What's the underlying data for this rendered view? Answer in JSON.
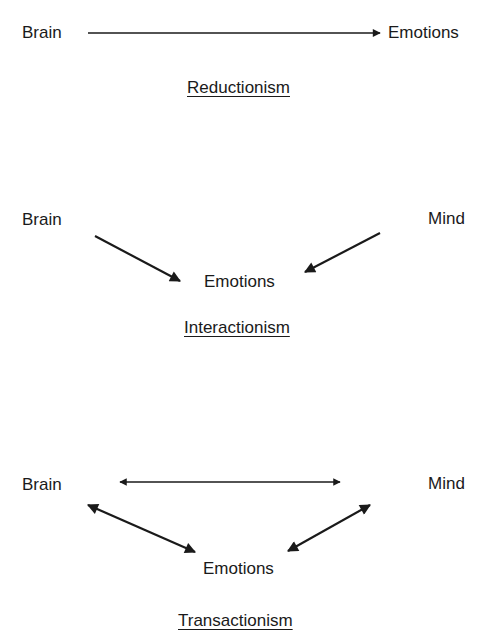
{
  "diagrams": [
    {
      "title": "Reductionism",
      "nodes": {
        "brain": "Brain",
        "emotions": "Emotions"
      },
      "relations": [
        {
          "from": "Brain",
          "to": "Emotions",
          "type": "one-way"
        }
      ]
    },
    {
      "title": "Interactionism",
      "nodes": {
        "brain": "Brain",
        "mind": "Mind",
        "emotions": "Emotions"
      },
      "relations": [
        {
          "from": "Brain",
          "to": "Emotions",
          "type": "one-way"
        },
        {
          "from": "Mind",
          "to": "Emotions",
          "type": "one-way"
        }
      ]
    },
    {
      "title": "Transactionism",
      "nodes": {
        "brain": "Brain",
        "mind": "Mind",
        "emotions": "Emotions"
      },
      "relations": [
        {
          "from": "Brain",
          "to": "Mind",
          "type": "two-way"
        },
        {
          "from": "Brain",
          "to": "Emotions",
          "type": "two-way"
        },
        {
          "from": "Mind",
          "to": "Emotions",
          "type": "two-way"
        }
      ]
    }
  ],
  "colors": {
    "ink": "#1a1a1a",
    "background": "#ffffff"
  }
}
